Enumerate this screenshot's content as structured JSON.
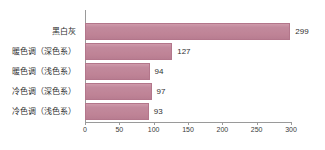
{
  "chart_data": {
    "type": "bar",
    "orientation": "horizontal",
    "title": "",
    "subtitle": "",
    "xlabel": "",
    "ylabel": "",
    "categories": [
      "黑白灰",
      "暖色调（深色系）",
      "暖色调（浅色系）",
      "冷色调（深色系）",
      "冷色调（浅色系）"
    ],
    "values": [
      299,
      127,
      94,
      97,
      93
    ],
    "value_labels": [
      "299",
      "127",
      "94",
      "97",
      "93"
    ],
    "xlim": [
      0,
      300
    ],
    "x_ticks": [
      0,
      50,
      100,
      150,
      200,
      250,
      300
    ],
    "x_tick_labels": [
      "0",
      "50",
      "100",
      "150",
      "200",
      "250",
      "300"
    ],
    "grid": false,
    "legend": false,
    "legend_position": "none",
    "bar_color": "#c28a9d",
    "bar_border_color": "#b3768b",
    "axis_color": "#9a9a9a",
    "background_color": "#ffffff",
    "text_color": "#2f2f2f"
  }
}
